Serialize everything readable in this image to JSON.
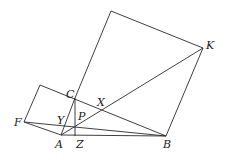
{
  "diagram": {
    "points": {
      "A": [
        61,
        135
      ],
      "B": [
        166,
        136
      ],
      "C": [
        75,
        98
      ],
      "K": [
        203,
        48
      ],
      "F": [
        24,
        122
      ],
      "Q": [
        111,
        11
      ],
      "G": [
        40,
        85
      ],
      "X": [
        102,
        110
      ],
      "Y": [
        67,
        126
      ],
      "P": [
        75,
        127
      ],
      "Z": [
        75,
        136
      ]
    },
    "labels": [
      {
        "text": "A",
        "x": 55,
        "y": 148
      },
      {
        "text": "B",
        "x": 163,
        "y": 148
      },
      {
        "text": "C",
        "x": 66,
        "y": 98
      },
      {
        "text": "K",
        "x": 206,
        "y": 49
      },
      {
        "text": "F",
        "x": 14,
        "y": 126
      },
      {
        "text": "X",
        "x": 97,
        "y": 106
      },
      {
        "text": "Y",
        "x": 57,
        "y": 124
      },
      {
        "text": "P",
        "x": 78,
        "y": 120
      },
      {
        "text": "Z",
        "x": 76,
        "y": 148
      }
    ],
    "segments": [
      [
        "C",
        "Q"
      ],
      [
        "Q",
        "K"
      ],
      [
        "K",
        "B"
      ],
      [
        "A",
        "F"
      ],
      [
        "F",
        "G"
      ],
      [
        "G",
        "B"
      ],
      [
        "A",
        "B"
      ],
      [
        "A",
        "C"
      ],
      [
        "A",
        "K"
      ],
      [
        "F",
        "B"
      ],
      [
        "C",
        "Z"
      ]
    ]
  }
}
